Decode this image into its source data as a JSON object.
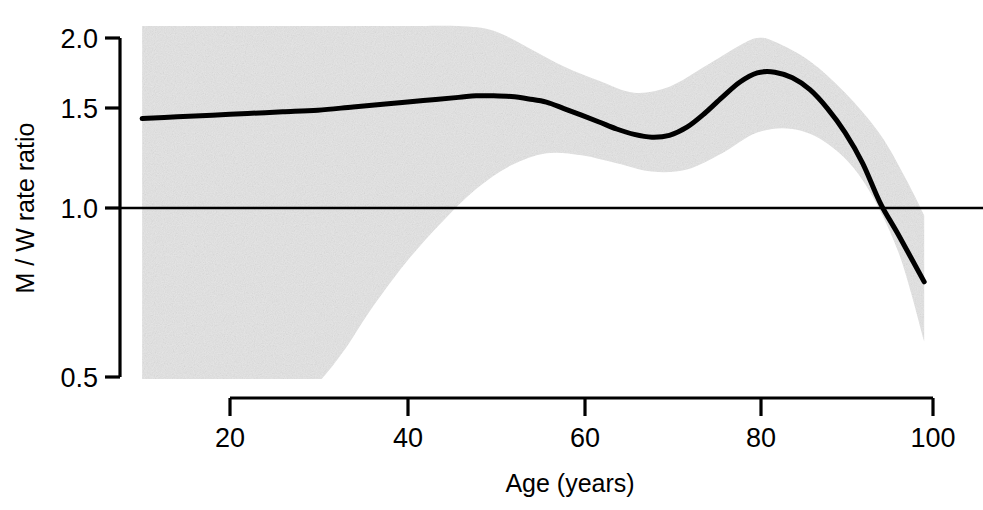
{
  "chart_data": {
    "type": "line",
    "title": "",
    "subtitle": "",
    "xlabel": "Age (years)",
    "ylabel": "M / W rate ratio",
    "xlim": [
      10,
      99
    ],
    "ylim": [
      0.5,
      2.0
    ],
    "yscale": "log",
    "xscale": "linear",
    "grid": false,
    "legend": false,
    "legend_position": "none",
    "xticks": [
      20,
      40,
      60,
      80,
      100
    ],
    "xtick_labels": [
      "20",
      "40",
      "60",
      "80",
      "100"
    ],
    "yticks": [
      0.5,
      1.0,
      1.5,
      2.0
    ],
    "ytick_labels": [
      "0.5",
      "1.0",
      "1.5",
      "2.0"
    ],
    "reference_line": {
      "name": "null-effect-line",
      "y": 1.0,
      "color": "#000000",
      "style": "solid"
    },
    "series": [
      {
        "name": "M / W rate ratio (smoothed estimate)",
        "style": "line",
        "color": "#000000",
        "linewidth": 5,
        "x": [
          10,
          14,
          18,
          22,
          26,
          30,
          34,
          38,
          42,
          46,
          48,
          50,
          52,
          54,
          56,
          58,
          60,
          62,
          64,
          66,
          68,
          70,
          72,
          74,
          76,
          78,
          80,
          82,
          84,
          86,
          88,
          90,
          92,
          94,
          96,
          99
        ],
        "y": [
          1.44,
          1.45,
          1.46,
          1.47,
          1.48,
          1.49,
          1.51,
          1.53,
          1.55,
          1.57,
          1.58,
          1.58,
          1.575,
          1.56,
          1.54,
          1.5,
          1.46,
          1.42,
          1.38,
          1.35,
          1.335,
          1.345,
          1.39,
          1.47,
          1.57,
          1.67,
          1.735,
          1.74,
          1.7,
          1.62,
          1.5,
          1.36,
          1.2,
          1.02,
          0.9,
          0.74
        ]
      },
      {
        "name": "95% confidence band (upper)",
        "style": "band-upper",
        "color": "#e4e4e4",
        "x": [
          10,
          20,
          30,
          40,
          46,
          50,
          54,
          58,
          62,
          66,
          70,
          74,
          78,
          80,
          82,
          86,
          90,
          94,
          97,
          99
        ],
        "y": [
          2.1,
          2.1,
          2.1,
          2.1,
          2.1,
          2.06,
          1.92,
          1.78,
          1.68,
          1.6,
          1.64,
          1.78,
          1.94,
          2.0,
          1.97,
          1.82,
          1.6,
          1.35,
          1.12,
          0.97
        ]
      },
      {
        "name": "95% confidence band (lower)",
        "style": "band-lower",
        "color": "#e4e4e4",
        "x": [
          10,
          18,
          24,
          28,
          30,
          33,
          36,
          40,
          44,
          48,
          52,
          56,
          60,
          64,
          68,
          72,
          76,
          80,
          84,
          88,
          92,
          96,
          99
        ],
        "y": [
          0.47,
          0.47,
          0.47,
          0.47,
          0.49,
          0.56,
          0.66,
          0.8,
          0.94,
          1.08,
          1.19,
          1.25,
          1.24,
          1.2,
          1.16,
          1.17,
          1.25,
          1.36,
          1.38,
          1.3,
          1.12,
          0.84,
          0.58
        ]
      }
    ],
    "annotations": [],
    "band_fill_color": "#e4e4e4",
    "line_color": "#000000",
    "axis_color": "#000000",
    "background_color": "#ffffff"
  },
  "axes": {
    "y_axis_title": "M / W rate ratio",
    "x_axis_title": "Age (years)"
  }
}
